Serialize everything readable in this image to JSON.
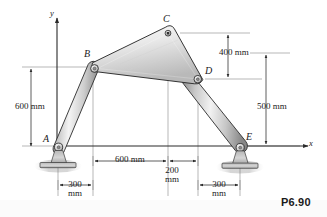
{
  "figure": {
    "problem_label": "P6.90",
    "axes": {
      "y_label": "y",
      "x_label": "x"
    },
    "joints": [
      {
        "id": "A",
        "label": "A",
        "x": 58,
        "y": 145,
        "type": "pin-support"
      },
      {
        "id": "B",
        "label": "B",
        "x": 93,
        "y": 67,
        "type": "pin-joint"
      },
      {
        "id": "C",
        "label": "C",
        "x": 168,
        "y": 33,
        "type": "pin-joint"
      },
      {
        "id": "D",
        "label": "D",
        "x": 198,
        "y": 79,
        "type": "pin-joint"
      },
      {
        "id": "E",
        "label": "E",
        "x": 240,
        "y": 146,
        "type": "pin-support"
      }
    ],
    "members": [
      {
        "id": "AB",
        "from": "A",
        "to": "B",
        "kind": "two-force-link"
      },
      {
        "id": "DE",
        "from": "D",
        "to": "E",
        "kind": "two-force-link"
      },
      {
        "id": "BCD",
        "kind": "triangular-plate",
        "vertices": [
          "B",
          "C",
          "D"
        ]
      }
    ],
    "dimensions": [
      {
        "id": "v-600",
        "value": "600",
        "unit": "mm",
        "text": "600 mm",
        "orientation": "vertical",
        "from": "x-axis",
        "to": "B-level"
      },
      {
        "id": "v-400",
        "value": "400",
        "unit": "mm",
        "text": "400 mm",
        "orientation": "vertical",
        "from": "C-level",
        "to": "D-level"
      },
      {
        "id": "v-500",
        "value": "500",
        "unit": "mm",
        "text": "500 mm",
        "orientation": "vertical",
        "from": "D-level",
        "to": "x-axis"
      },
      {
        "id": "h-600",
        "value": "600",
        "unit": "mm",
        "text": "600 mm",
        "orientation": "horizontal",
        "from": "B-station",
        "to": "C-station"
      },
      {
        "id": "h-200",
        "value": "200",
        "unit": "mm",
        "text": "200\nmm",
        "line1": "200",
        "line2": "mm",
        "orientation": "horizontal",
        "from": "C-station",
        "to": "D-station"
      },
      {
        "id": "h-300-left",
        "value": "300",
        "unit": "mm",
        "line1": "300",
        "line2": "mm",
        "orientation": "horizontal",
        "from": "A-station",
        "to": "B-station"
      },
      {
        "id": "h-300-right",
        "value": "300",
        "unit": "mm",
        "line1": "300",
        "line2": "mm",
        "orientation": "horizontal",
        "from": "D-station",
        "to": "E-station"
      }
    ],
    "colors": {
      "line": "#1a1a1a",
      "plate_light": "#f2f2f2",
      "plate_mid": "#d8d8d8",
      "plate_dark": "#b4b4b4",
      "link_light": "#efefef",
      "link_mid": "#c9c9c9",
      "link_dark": "#8e8e8e",
      "ground": "#c9c9c9",
      "dim_line": "#4a4a4a"
    }
  }
}
